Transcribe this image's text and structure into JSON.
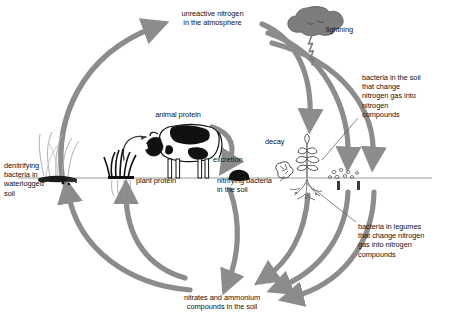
{
  "diagram": {
    "type": "cycle-diagram",
    "colors": {
      "arrow": "#8c8c8c",
      "text": "#111111",
      "ground_line": "#8a8a8a",
      "cloud": "#7d7d7d",
      "animal_dark": "#151515",
      "plant": "#4a4a4a",
      "background": "#ffffff"
    }
  },
  "labels": {
    "atmosphere": "unreactive nitrogen\nin the atmosphere",
    "lightning": "lightning",
    "soil_bacteria": "bacteria in the soil\nthat change\nnitrogen gas into\nnitrogen\ncompounds",
    "legume_bacteria": "bacteria in legumes\nthat change nitrogen\ngas into nitrogen\ncompounds",
    "denitrifying": "denitrifying\nbacteria in\nwaterlogged\nsoil",
    "animal_protein": "animal protein",
    "plant_protein": "plant protein",
    "excretion": "excretion",
    "decay": "decay",
    "nitrifying": "nitrifying bacteria\nin the soil",
    "nitrates": "nitrates and ammonium\ncompounds in the soil"
  },
  "nodes": [
    {
      "id": "atmosphere",
      "label": "unreactive nitrogen in the atmosphere"
    },
    {
      "id": "lightning",
      "label": "lightning"
    },
    {
      "id": "soil_bacteria",
      "label": "bacteria in the soil that change nitrogen gas into nitrogen compounds"
    },
    {
      "id": "legume_bacteria",
      "label": "bacteria in legumes that change nitrogen gas into nitrogen compounds"
    },
    {
      "id": "denitrifying",
      "label": "denitrifying bacteria in waterlogged soil"
    },
    {
      "id": "animal_protein",
      "label": "animal protein"
    },
    {
      "id": "plant_protein",
      "label": "plant protein"
    },
    {
      "id": "excretion",
      "label": "excretion"
    },
    {
      "id": "decay",
      "label": "decay"
    },
    {
      "id": "nitrifying",
      "label": "nitrifying bacteria in the soil"
    },
    {
      "id": "nitrates",
      "label": "nitrates and ammonium compounds in the soil"
    }
  ],
  "arrows": [
    {
      "from": "denitrifying",
      "to": "atmosphere"
    },
    {
      "from": "atmosphere",
      "to": "lightning_deposition"
    },
    {
      "from": "atmosphere",
      "to": "soil_bacteria"
    },
    {
      "from": "atmosphere",
      "to": "legume_bacteria"
    },
    {
      "from": "nitrates",
      "to": "denitrifying"
    },
    {
      "from": "nitrates",
      "to": "plant_protein"
    },
    {
      "from": "plant_protein",
      "to": "animal_protein"
    },
    {
      "from": "excretion",
      "to": "nitrates"
    },
    {
      "from": "decay",
      "to": "nitrates"
    },
    {
      "from": "soil_bacteria",
      "to": "nitrates"
    },
    {
      "from": "legume_bacteria",
      "to": "nitrates"
    },
    {
      "from": "animal_protein",
      "to": "excretion"
    }
  ]
}
